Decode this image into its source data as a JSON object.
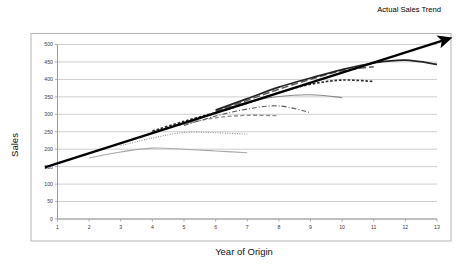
{
  "figure": {
    "background": "#ffffff",
    "border_color": "#b4b4b4",
    "plot_bg": "#ffffff",
    "gridline_color": "#b9b9b9",
    "axis_color": "#9a9a9a"
  },
  "annotation": {
    "label": "Actual Sales Trend",
    "color": "#000000"
  },
  "axis": {
    "x_title": "Year of Origin",
    "y_title": "Sales",
    "x_ticks": [
      "1",
      "2",
      "3",
      "4",
      "5",
      "6",
      "7",
      "8",
      "9",
      "10",
      "11",
      "12",
      "13"
    ],
    "y_ticks": [
      "0",
      "50",
      "100",
      "150",
      "200",
      "250",
      "300",
      "350",
      "400",
      "450",
      "500"
    ]
  },
  "chart_data": {
    "type": "line",
    "title": "",
    "subtitle": "",
    "xlabel": "Year of Origin",
    "ylabel": "Sales",
    "xlim": [
      1,
      13
    ],
    "ylim": [
      0,
      500
    ],
    "xticks": [
      1,
      2,
      3,
      4,
      5,
      6,
      7,
      8,
      9,
      10,
      11,
      12,
      13
    ],
    "yticks": [
      0,
      50,
      100,
      150,
      200,
      250,
      300,
      350,
      400,
      450,
      500
    ],
    "grid": "horizontal",
    "legend": "none",
    "annotations": [
      {
        "text": "Actual Sales Trend",
        "type": "arrow",
        "color": "#000000",
        "x_start": 0.6,
        "y_start": 148,
        "x_end": 13.2,
        "y_end": 512
      }
    ],
    "series": [
      {
        "name": "cohort-1",
        "style": "solid",
        "color": "#a8a8a8",
        "width": 1.1,
        "x": [
          2,
          3,
          4,
          5,
          6,
          7
        ],
        "values": [
          175,
          192,
          203,
          200,
          195,
          190
        ]
      },
      {
        "name": "cohort-2",
        "style": "dotted",
        "color": "#6e6e6e",
        "width": 1.0,
        "x": [
          3,
          4,
          5,
          6,
          7
        ],
        "values": [
          210,
          232,
          248,
          247,
          243
        ]
      },
      {
        "name": "cohort-3",
        "style": "dashed",
        "color": "#8c8c8c",
        "width": 1.3,
        "x": [
          4,
          5,
          6,
          7,
          8
        ],
        "values": [
          250,
          272,
          290,
          297,
          296
        ]
      },
      {
        "name": "cohort-4",
        "style": "dash-dot",
        "color": "#5a5a5a",
        "width": 1.1,
        "x": [
          5,
          6,
          7,
          8,
          9
        ],
        "values": [
          268,
          295,
          315,
          324,
          305
        ]
      },
      {
        "name": "cohort-5",
        "style": "solid",
        "color": "#8a8a8a",
        "width": 1.2,
        "x": [
          5,
          6,
          7,
          8,
          9,
          10
        ],
        "values": [
          270,
          305,
          335,
          351,
          356,
          348
        ]
      },
      {
        "name": "cohort-6",
        "style": "short-dash",
        "color": "#2b2b2b",
        "width": 1.6,
        "x": [
          4,
          5,
          6,
          7,
          8,
          9,
          10,
          11
        ],
        "values": [
          252,
          280,
          305,
          332,
          362,
          386,
          398,
          394
        ]
      },
      {
        "name": "cohort-7",
        "style": "long-dash",
        "color": "#5a5a5a",
        "width": 1.5,
        "x": [
          6,
          7,
          8,
          9,
          10,
          11
        ],
        "values": [
          308,
          340,
          372,
          400,
          425,
          436
        ]
      },
      {
        "name": "cohort-8",
        "style": "solid",
        "color": "#242424",
        "width": 1.7,
        "x": [
          6,
          7,
          8,
          9,
          10,
          11,
          12,
          13
        ],
        "values": [
          312,
          345,
          378,
          404,
          428,
          447,
          455,
          443
        ]
      }
    ]
  }
}
